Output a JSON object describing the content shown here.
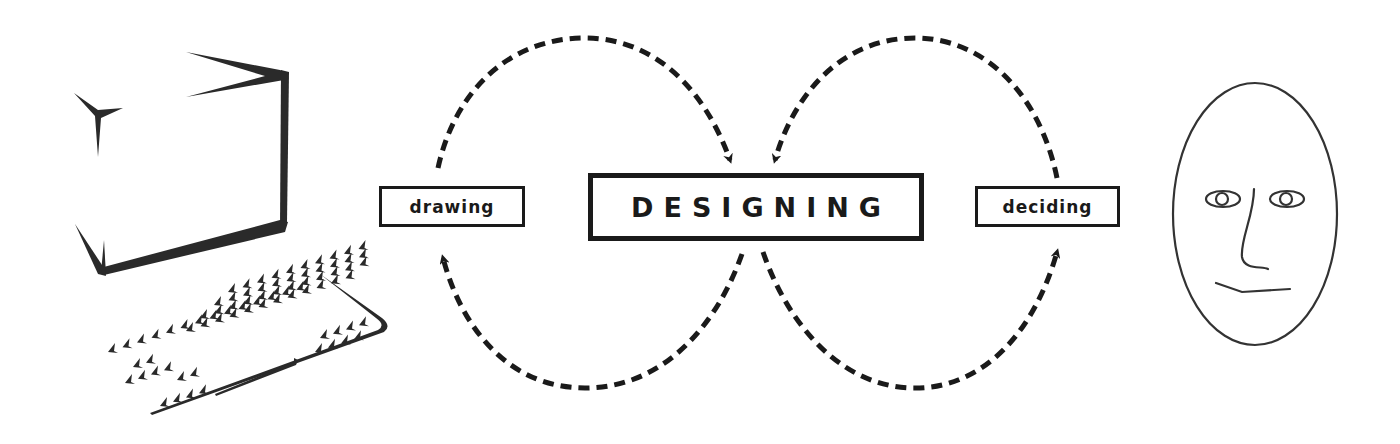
{
  "diagram": {
    "center_node": {
      "label": "DESIGNING"
    },
    "left_node": {
      "label": "drawing"
    },
    "right_node": {
      "label": "deciding"
    },
    "left_figure": {
      "icon": "computer-icon",
      "description": "computer monitor and keyboard"
    },
    "right_figure": {
      "icon": "face-icon",
      "description": "human face"
    },
    "edges": [
      {
        "from": "drawing",
        "to": "DESIGNING",
        "route": "over-top",
        "style": "dashed"
      },
      {
        "from": "DESIGNING",
        "to": "drawing",
        "route": "under-bottom",
        "style": "dashed"
      },
      {
        "from": "deciding",
        "to": "DESIGNING",
        "route": "over-top",
        "style": "dashed"
      },
      {
        "from": "DESIGNING",
        "to": "deciding",
        "route": "under-bottom",
        "style": "dashed"
      }
    ],
    "colors": {
      "ink": "#1a1a1a",
      "face_line": "#333333",
      "background": "#ffffff"
    }
  }
}
